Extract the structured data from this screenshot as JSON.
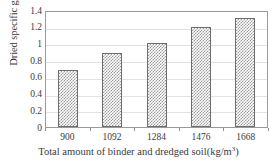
{
  "chart_data": {
    "type": "bar",
    "title": "",
    "subtitle": "",
    "xlabel": "Total amount of binder and dredged soil(kg/m",
    "xlabel_superscript": "3",
    "xlabel_suffix": ")",
    "ylabel": "Dried specific gravity",
    "categories": [
      "900",
      "1092",
      "1284",
      "1476",
      "1668"
    ],
    "values": [
      0.68,
      0.88,
      1.0,
      1.2,
      1.31
    ],
    "ylim": [
      0,
      1.4
    ],
    "ytick_values": [
      1.4,
      1.2,
      1.0,
      0.8,
      0.6,
      0.4,
      0.2,
      0
    ],
    "ytick_labels": [
      "1.4",
      "1.2",
      "1",
      "0.8",
      "0.6",
      "0.4",
      "0.2",
      "0"
    ],
    "grid": "horizontal",
    "legend": "none",
    "series": [
      {
        "name": "Dried specific gravity",
        "values": [
          0.68,
          0.88,
          1.0,
          1.2,
          1.31
        ]
      }
    ],
    "colors": {
      "bar_pattern": "#9d9d9d",
      "bar_background": "#ffffff",
      "bar_border": "#6d6d6d",
      "gridline": "#e2e2e2",
      "axis_frame": "#9a9a9a",
      "text": "#3b3b3b"
    }
  }
}
